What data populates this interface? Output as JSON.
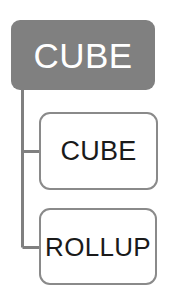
{
  "diagram": {
    "type": "tree",
    "orientation": "vertical-root-left-spine",
    "background_color": "#ffffff",
    "connector_color": "#808080",
    "root": {
      "label": "CUBE",
      "fill_color": "#808080",
      "text_color": "#ffffff",
      "shape": "rounded-rectangle"
    },
    "children": [
      {
        "label": "CUBE",
        "fill_color": "#ffffff",
        "border_color": "#8a8a8a",
        "text_color": "#1a1a1a",
        "shape": "rounded-rectangle"
      },
      {
        "label": "ROLLUP",
        "fill_color": "#ffffff",
        "border_color": "#8a8a8a",
        "text_color": "#1a1a1a",
        "shape": "rounded-rectangle"
      }
    ]
  }
}
